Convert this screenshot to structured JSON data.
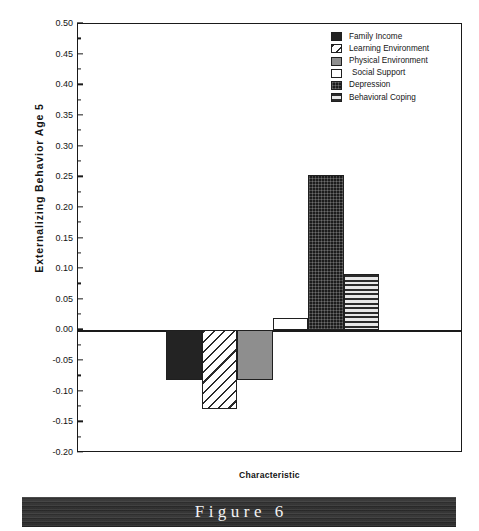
{
  "chart_data": {
    "type": "bar",
    "title": "",
    "xlabel": "Characteristic",
    "ylabel": "Externalizing  Behavior  Age  5",
    "ylim": [
      -0.2,
      0.5
    ],
    "ytick_step": 0.05,
    "grid": false,
    "legend_position": "top-right",
    "categories": [
      "Family Income",
      "Learning Environment",
      "Physical Environment",
      "Social Support",
      "Depression",
      "Behavioral Coping"
    ],
    "values": [
      -0.081,
      -0.129,
      -0.081,
      0.02,
      0.253,
      0.092
    ],
    "ytick_labels": [
      "0.50",
      "0.45",
      "0.40",
      "0.35",
      "0.30",
      "0.25",
      "0.20",
      "0.15",
      "0.10",
      "0.05",
      "0.00",
      "-0.05",
      "-0.10",
      "-0.15",
      "-0.20"
    ],
    "ytick_values": [
      0.5,
      0.45,
      0.4,
      0.35,
      0.3,
      0.25,
      0.2,
      0.15,
      0.1,
      0.05,
      0.0,
      -0.05,
      -0.1,
      -0.15,
      -0.2
    ],
    "bar_styles": [
      "solid-black",
      "diagonal-hatch",
      "solid-gray",
      "white",
      "stipple-black",
      "horizontal-stripe"
    ]
  },
  "legend": {
    "items": [
      {
        "label": "Family Income",
        "style": "solid-black"
      },
      {
        "label": "Learning Environment",
        "style": "diagonal-hatch"
      },
      {
        "label": "Physical Environment",
        "style": "solid-gray"
      },
      {
        "label": "Social Support",
        "style": "white"
      },
      {
        "label": "Depression",
        "style": "stipple-black"
      },
      {
        "label": "Behavioral Coping",
        "style": "horizontal-stripe"
      }
    ]
  },
  "caption": {
    "text": "Figure 6"
  },
  "colors": {
    "axis": "#1a1a1a",
    "black_fill": "#232323",
    "gray_fill": "#8e8e8e",
    "banner_bg": "#2c2c2c",
    "banner_text": "#f2f2f2"
  }
}
